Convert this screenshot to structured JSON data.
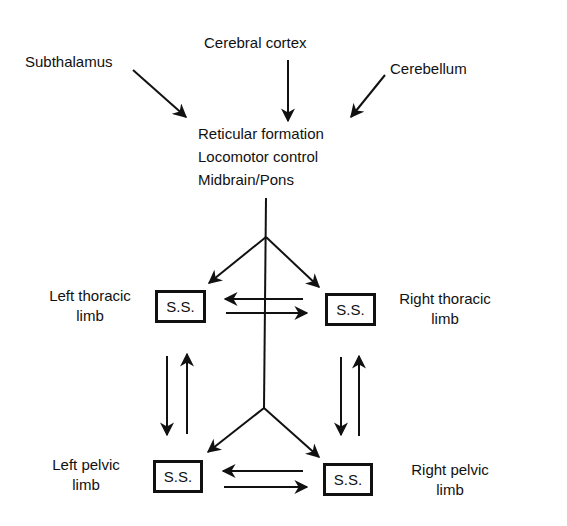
{
  "inputs": {
    "subthalamus": "Subthalamus",
    "cerebral_cortex": "Cerebral cortex",
    "cerebellum": "Cerebellum"
  },
  "center": {
    "lines": [
      "Reticular formation",
      "Locomotor control",
      "Midbrain/Pons"
    ]
  },
  "limbs": {
    "left_thoracic": {
      "line1": "Left thoracic",
      "line2": "limb",
      "box": "S.S."
    },
    "right_thoracic": {
      "line1": "Right thoracic",
      "line2": "limb",
      "box": "S.S."
    },
    "left_pelvic": {
      "line1": "Left pelvic",
      "line2": "limb",
      "box": "S.S."
    },
    "right_pelvic": {
      "line1": "Right pelvic",
      "line2": "limb",
      "box": "S.S."
    }
  },
  "colors": {
    "ink": "#111111",
    "background": "#ffffff"
  }
}
